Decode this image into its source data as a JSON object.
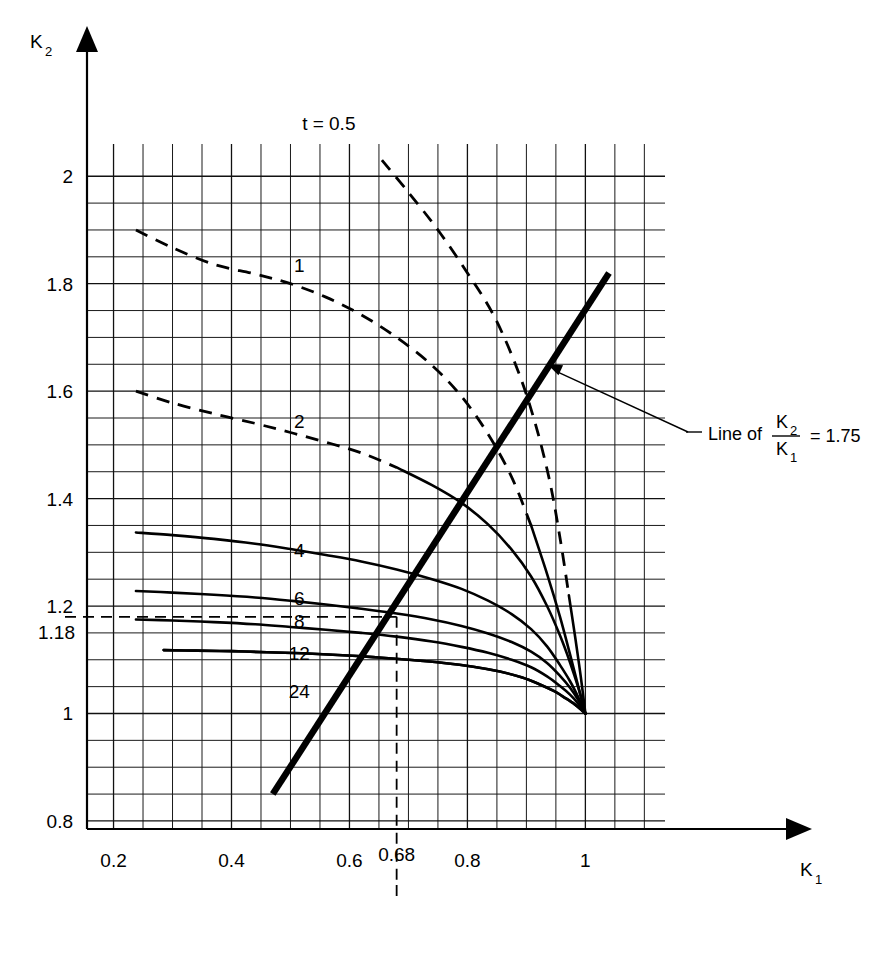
{
  "chart_data": {
    "type": "line",
    "title": "",
    "xlabel": "K_1",
    "ylabel": "K_2",
    "xlim": [
      0.155,
      1.135
    ],
    "ylim": [
      0.785,
      2.06
    ],
    "grid": true,
    "grid_minor_x": 0.05,
    "grid_minor_y": 0.05,
    "legend": "inline curve labels",
    "x_ticks": [
      "0.2",
      "0.4",
      "0.6",
      "0.8",
      "1"
    ],
    "x_tick_values": [
      0.2,
      0.4,
      0.6,
      0.8,
      1.0
    ],
    "x_special_tick": "0.68",
    "x_special_tick_value": 0.68,
    "y_ticks": [
      "0.8",
      "1",
      "1.2",
      "1.4",
      "1.6",
      "1.8",
      "2"
    ],
    "y_tick_values": [
      0.8,
      1.0,
      1.2,
      1.4,
      1.6,
      1.8,
      2.0
    ],
    "y_special_tick": "1.18",
    "y_special_tick_value": 1.18,
    "convergence_point": [
      1.0,
      1.0
    ],
    "series": [
      {
        "name": "t = 0.5",
        "label": "t = 0.5",
        "style": "dashed-to-solid",
        "points": [
          [
            0.655,
            2.03
          ],
          [
            0.7,
            1.97
          ],
          [
            0.75,
            1.9
          ],
          [
            0.8,
            1.82
          ],
          [
            0.845,
            1.74
          ],
          [
            0.885,
            1.64
          ],
          [
            0.915,
            1.54
          ],
          [
            0.94,
            1.43
          ],
          [
            0.958,
            1.32
          ],
          [
            0.972,
            1.22
          ],
          [
            0.983,
            1.14
          ],
          [
            0.992,
            1.07
          ],
          [
            1.0,
            1.0
          ]
        ],
        "dash_end_index": 9
      },
      {
        "name": "1",
        "label": "1",
        "style": "dashed-to-solid",
        "points": [
          [
            0.238,
            1.9
          ],
          [
            0.3,
            1.867
          ],
          [
            0.37,
            1.836
          ],
          [
            0.44,
            1.818
          ],
          [
            0.5,
            1.8
          ],
          [
            0.56,
            1.775
          ],
          [
            0.62,
            1.742
          ],
          [
            0.68,
            1.7
          ],
          [
            0.74,
            1.648
          ],
          [
            0.79,
            1.59
          ],
          [
            0.835,
            1.52
          ],
          [
            0.875,
            1.44
          ],
          [
            0.908,
            1.35
          ],
          [
            0.935,
            1.26
          ],
          [
            0.957,
            1.18
          ],
          [
            0.974,
            1.11
          ],
          [
            0.988,
            1.05
          ],
          [
            1.0,
            1.0
          ]
        ],
        "dash_end_index": 12
      },
      {
        "name": "2",
        "label": "2",
        "style": "dashed-to-solid",
        "points": [
          [
            0.238,
            1.6
          ],
          [
            0.3,
            1.578
          ],
          [
            0.37,
            1.558
          ],
          [
            0.44,
            1.54
          ],
          [
            0.5,
            1.523
          ],
          [
            0.56,
            1.505
          ],
          [
            0.62,
            1.485
          ],
          [
            0.68,
            1.458
          ],
          [
            0.74,
            1.425
          ],
          [
            0.79,
            1.392
          ],
          [
            0.835,
            1.352
          ],
          [
            0.875,
            1.305
          ],
          [
            0.908,
            1.255
          ],
          [
            0.935,
            1.2
          ],
          [
            0.957,
            1.145
          ],
          [
            0.974,
            1.095
          ],
          [
            0.988,
            1.048
          ],
          [
            1.0,
            1.0
          ]
        ],
        "dash_end_index": 7
      },
      {
        "name": "4",
        "label": "4",
        "style": "solid",
        "points": [
          [
            0.238,
            1.337
          ],
          [
            0.3,
            1.332
          ],
          [
            0.37,
            1.325
          ],
          [
            0.44,
            1.316
          ],
          [
            0.5,
            1.306
          ],
          [
            0.56,
            1.295
          ],
          [
            0.62,
            1.283
          ],
          [
            0.68,
            1.268
          ],
          [
            0.74,
            1.25
          ],
          [
            0.79,
            1.232
          ],
          [
            0.835,
            1.21
          ],
          [
            0.875,
            1.185
          ],
          [
            0.908,
            1.157
          ],
          [
            0.935,
            1.125
          ],
          [
            0.957,
            1.09
          ],
          [
            0.974,
            1.06
          ],
          [
            0.988,
            1.03
          ],
          [
            1.0,
            1.0
          ]
        ]
      },
      {
        "name": "6",
        "label": "6",
        "style": "solid",
        "points": [
          [
            0.238,
            1.228
          ],
          [
            0.3,
            1.225
          ],
          [
            0.37,
            1.221
          ],
          [
            0.44,
            1.216
          ],
          [
            0.5,
            1.21
          ],
          [
            0.56,
            1.203
          ],
          [
            0.62,
            1.195
          ],
          [
            0.68,
            1.186
          ],
          [
            0.74,
            1.175
          ],
          [
            0.79,
            1.163
          ],
          [
            0.835,
            1.149
          ],
          [
            0.875,
            1.133
          ],
          [
            0.908,
            1.115
          ],
          [
            0.935,
            1.094
          ],
          [
            0.957,
            1.07
          ],
          [
            0.974,
            1.048
          ],
          [
            0.988,
            1.025
          ],
          [
            1.0,
            1.0
          ]
        ]
      },
      {
        "name": "8",
        "label": "8",
        "style": "solid",
        "points": [
          [
            0.238,
            1.175
          ],
          [
            0.3,
            1.173
          ],
          [
            0.37,
            1.17
          ],
          [
            0.44,
            1.166
          ],
          [
            0.5,
            1.161
          ],
          [
            0.56,
            1.156
          ],
          [
            0.62,
            1.15
          ],
          [
            0.68,
            1.143
          ],
          [
            0.74,
            1.134
          ],
          [
            0.79,
            1.124
          ],
          [
            0.835,
            1.113
          ],
          [
            0.875,
            1.1
          ],
          [
            0.908,
            1.086
          ],
          [
            0.935,
            1.069
          ],
          [
            0.957,
            1.051
          ],
          [
            0.974,
            1.035
          ],
          [
            0.988,
            1.018
          ],
          [
            1.0,
            1.0
          ]
        ]
      },
      {
        "name": "12",
        "label": "12",
        "style": "solid",
        "points": [
          [
            0.285,
            1.118
          ],
          [
            0.34,
            1.117
          ],
          [
            0.4,
            1.116
          ],
          [
            0.46,
            1.114
          ],
          [
            0.52,
            1.112
          ],
          [
            0.58,
            1.109
          ],
          [
            0.64,
            1.105
          ],
          [
            0.7,
            1.1
          ],
          [
            0.76,
            1.094
          ],
          [
            0.81,
            1.087
          ],
          [
            0.855,
            1.078
          ],
          [
            0.893,
            1.067
          ],
          [
            0.923,
            1.054
          ],
          [
            0.948,
            1.041
          ],
          [
            0.967,
            1.028
          ],
          [
            0.982,
            1.017
          ],
          [
            0.992,
            1.008
          ],
          [
            1.0,
            1.0
          ]
        ]
      },
      {
        "name": "24",
        "label": "24",
        "style": "solid",
        "points": [
          [
            0.285,
            1.118
          ],
          [
            0.34,
            1.117
          ],
          [
            0.4,
            1.116
          ],
          [
            0.46,
            1.114
          ],
          [
            0.52,
            1.112
          ],
          [
            0.58,
            1.109
          ],
          [
            0.64,
            1.105
          ],
          [
            0.7,
            1.1
          ],
          [
            0.76,
            1.094
          ],
          [
            0.81,
            1.087
          ],
          [
            0.855,
            1.078
          ],
          [
            0.893,
            1.067
          ],
          [
            0.923,
            1.054
          ],
          [
            0.948,
            1.041
          ],
          [
            0.967,
            1.028
          ],
          [
            0.982,
            1.017
          ],
          [
            0.992,
            1.008
          ],
          [
            1.0,
            1.0
          ]
        ]
      }
    ],
    "curve_label_positions": [
      {
        "label": "t = 0.5",
        "x": 0.565,
        "y": 2.1
      },
      {
        "label": "1",
        "x": 0.515,
        "y": 1.835
      },
      {
        "label": "2",
        "x": 0.515,
        "y": 1.545
      },
      {
        "label": "4",
        "x": 0.515,
        "y": 1.305
      },
      {
        "label": "6",
        "x": 0.515,
        "y": 1.215
      },
      {
        "label": "8",
        "x": 0.515,
        "y": 1.172
      },
      {
        "label": "12",
        "x": 0.515,
        "y": 1.112
      },
      {
        "label": "24",
        "x": 0.515,
        "y": 1.042
      }
    ],
    "reference_line": {
      "label_prefix": "Line of",
      "numerator": "K",
      "numerator_sub": "2",
      "denominator": "K",
      "denominator_sub": "1",
      "equals": "= 1.75",
      "ratio_value": 1.75,
      "start": [
        0.47,
        0.85
      ],
      "end": [
        1.04,
        1.82
      ]
    },
    "construction_lines": [
      {
        "name": "horizontal-1.18",
        "orientation": "horizontal",
        "value": 1.18,
        "from": 0.155,
        "to": 0.68
      },
      {
        "name": "vertical-0.68",
        "orientation": "vertical",
        "value": 0.68,
        "from": 0.755,
        "to": 1.18
      }
    ],
    "annotations": [
      {
        "name": "reference-line-callout",
        "text": "Line of K2/K1 = 1.75"
      }
    ]
  },
  "axes": {
    "y_axis_label": "K",
    "y_axis_sub": "2",
    "x_axis_label": "K",
    "x_axis_sub": "1"
  }
}
